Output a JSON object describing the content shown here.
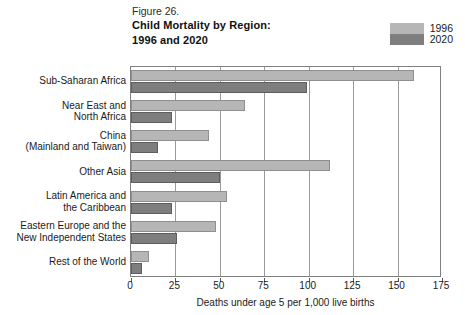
{
  "figure": {
    "number": "Figure 26.",
    "title_line1": "Child Mortality by Region:",
    "title_line2": "1996 and 2020"
  },
  "legend": {
    "position": "top-right",
    "entries": [
      {
        "label": "1996",
        "color": "#b6b6b6"
      },
      {
        "label": "2020",
        "color": "#7e7e7e"
      }
    ]
  },
  "chart_data": {
    "type": "bar",
    "orientation": "horizontal",
    "title": "Child Mortality by Region: 1996 and 2020",
    "xlabel": "Deaths under age 5 per 1,000 live births",
    "ylabel": "",
    "xlim": [
      0,
      175
    ],
    "xticks": [
      0,
      25,
      50,
      75,
      100,
      125,
      150,
      175
    ],
    "grid": true,
    "legend_position": "top-right",
    "categories": [
      "Sub-Saharan Africa",
      "Near East and North Africa",
      "China (Mainland and Taiwan)",
      "Other Asia",
      "Latin America and the Caribbean",
      "Eastern Europe and the New Independent States",
      "Rest of the World"
    ],
    "category_labels": [
      [
        "Sub-Saharan Africa"
      ],
      [
        "Near East and",
        "North Africa"
      ],
      [
        "China",
        "(Mainland and Taiwan)"
      ],
      [
        "Other Asia"
      ],
      [
        "Latin America and",
        "the Caribbean"
      ],
      [
        "Eastern Europe and the",
        "New Independent States"
      ],
      [
        "Rest of the World"
      ]
    ],
    "series": [
      {
        "name": "1996",
        "color": "#b6b6b6",
        "values": [
          159,
          64,
          44,
          112,
          54,
          48,
          10
        ]
      },
      {
        "name": "2020",
        "color": "#7e7e7e",
        "values": [
          99,
          23,
          15,
          50,
          23,
          26,
          6
        ]
      }
    ]
  },
  "axis": {
    "x_tick_labels": [
      "0",
      "25",
      "50",
      "75",
      "100",
      "125",
      "150",
      "175"
    ],
    "x_axis_title": "Deaths under age 5 per 1,000 live births"
  }
}
